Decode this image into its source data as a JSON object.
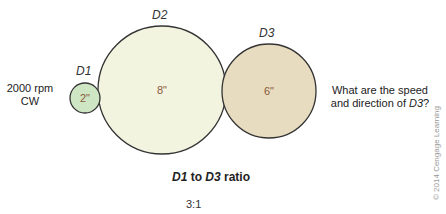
{
  "labels": {
    "d1": "D1",
    "d2": "D2",
    "d3": "D3"
  },
  "diameters": {
    "d1": "2\"",
    "d2": "8\"",
    "d3": "6\""
  },
  "input": {
    "speed": "2000 rpm",
    "direction": "CW"
  },
  "question": {
    "line1": "What are the speed",
    "line2_prefix": "and direction of ",
    "line2_var": "D3",
    "line2_suffix": "?"
  },
  "ratio": {
    "title_a": "D1",
    "title_mid": " to ",
    "title_b": "D3",
    "title_end": " ratio",
    "value": "3:1"
  },
  "copyright": "© 2014 Cengage Learning",
  "colors": {
    "d1_fill": "#cfe6c4",
    "d2_fill": "#f2f4e0",
    "d3_fill": "#e8dcc0",
    "stroke": "#333333",
    "value_text": "#8a5a3a"
  }
}
